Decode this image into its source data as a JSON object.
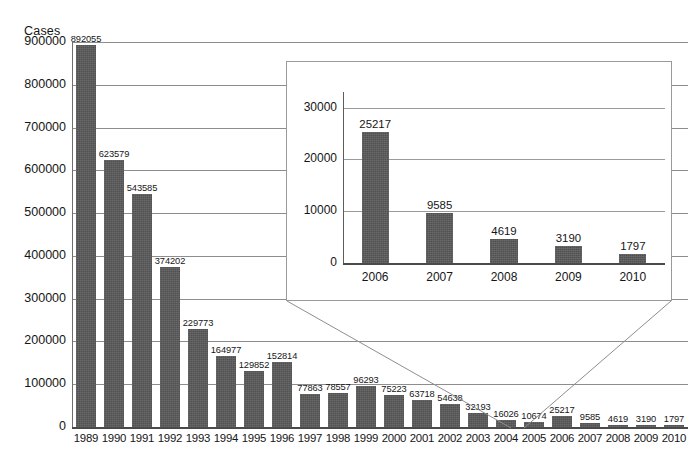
{
  "chart_data": {
    "type": "bar",
    "title": "",
    "ylabel": "Cases",
    "xlabel": "",
    "grid": true,
    "legend": "none",
    "ylim": [
      0,
      900000
    ],
    "ytick_labels": [
      "900000",
      "800000",
      "700000",
      "600000",
      "500000",
      "400000",
      "300000",
      "200000",
      "100000",
      "0"
    ],
    "yticks": [
      900000,
      800000,
      700000,
      600000,
      500000,
      400000,
      300000,
      200000,
      100000,
      0
    ],
    "categories": [
      "1989",
      "1990",
      "1991",
      "1992",
      "1993",
      "1994",
      "1995",
      "1996",
      "1997",
      "1998",
      "1999",
      "2000",
      "2001",
      "2002",
      "2003",
      "2004",
      "2005",
      "2006",
      "2007",
      "2008",
      "2009",
      "2010"
    ],
    "values": [
      892055,
      623579,
      543585,
      374202,
      229773,
      164977,
      129852,
      152814,
      77863,
      78557,
      96293,
      75223,
      63718,
      54638,
      32193,
      16026,
      10674,
      25217,
      9585,
      4619,
      3190,
      1797
    ],
    "data_labels": [
      "892055",
      "623579",
      "543585",
      "374202",
      "229773",
      "164977",
      "129852",
      "152814",
      "77863",
      "78557",
      "96293",
      "75223",
      "63718",
      "54638",
      "32193",
      "16026",
      "10674",
      "25217",
      "9585",
      "4619",
      "3190",
      "1797"
    ],
    "bar_color": "#585858",
    "inset": {
      "type": "bar",
      "ylim": [
        0,
        33000
      ],
      "ytick_labels": [
        "30000",
        "20000",
        "10000",
        "0"
      ],
      "yticks": [
        30000,
        20000,
        10000,
        0
      ],
      "categories": [
        "2006",
        "2007",
        "2008",
        "2009",
        "2010"
      ],
      "values": [
        25217,
        9585,
        4619,
        3190,
        1797
      ],
      "data_labels": [
        "25217",
        "9585",
        "4619",
        "3190",
        "1797"
      ],
      "bar_color": "#585858",
      "grid": true
    }
  }
}
